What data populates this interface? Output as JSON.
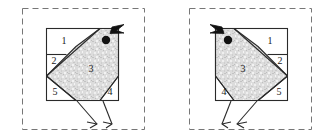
{
  "figure": {
    "type": "diagram",
    "panel_count": 2,
    "colors": {
      "stroke": "#2a2a2a",
      "fill_body": "#d9d9d9",
      "fill_plain": "#ffffff",
      "dash_border": "#6f6f6f",
      "eye": "#111111",
      "beak": "#111111",
      "background": "#ffffff"
    }
  },
  "panels": [
    {
      "id": "left-bird",
      "orientation": "facing-right",
      "labels": [
        "1",
        "2",
        "3",
        "4",
        "5"
      ],
      "piece_labels": {
        "p1": "1",
        "p2": "2",
        "p3": "3",
        "p4": "4",
        "p5": "5"
      },
      "parts": {
        "eye": "eye-dot",
        "beak": "beak-arrow",
        "legs": 2,
        "feet": 2
      }
    },
    {
      "id": "right-bird",
      "orientation": "facing-left",
      "labels": [
        "1",
        "2",
        "3",
        "4",
        "5"
      ],
      "piece_labels": {
        "p1": "1",
        "p2": "2",
        "p3": "3",
        "p4": "4",
        "p5": "5"
      },
      "parts": {
        "eye": "eye-dot",
        "beak": "beak-arrow",
        "legs": 2,
        "feet": 2
      }
    }
  ]
}
